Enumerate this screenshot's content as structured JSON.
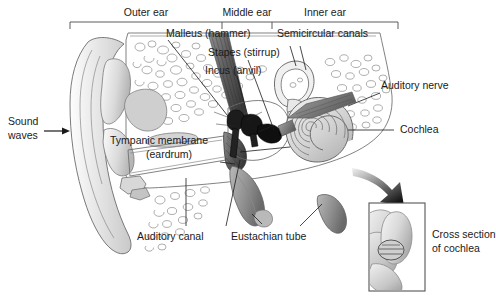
{
  "diagram": {
    "background_color": "#ffffff",
    "ink_color": "#1a1a1a",
    "outline_color": "#6b6b6b",
    "fill_light": "#e3e3e3",
    "fill_mid": "#bdbdbd",
    "fill_dark": "#555555",
    "fill_black": "#1c1c1c"
  },
  "region_brackets": {
    "outer_ear": {
      "label": "Outer ear"
    },
    "middle_ear": {
      "label": "Middle ear"
    },
    "inner_ear": {
      "label": "Inner ear"
    }
  },
  "labels": {
    "sound_waves_line1": "Sound",
    "sound_waves_line2": "waves",
    "malleus": "Malleus (hammer)",
    "stapes": "Stapes (stirrup)",
    "incus": "Incus (anvil)",
    "semicircular_canals": "Semicircular canals",
    "auditory_nerve": "Auditory nerve",
    "cochlea": "Cochlea",
    "tympanic_membrane_line1": "Tympanic membrane",
    "tympanic_membrane_line2": "(eardrum)",
    "auditory_canal": "Auditory canal",
    "eustachian_tube": "Eustachian tube",
    "cross_section_line1": "Cross section",
    "cross_section_line2": "of cochlea"
  },
  "icons": {
    "sound_arrow": "right-arrow-icon",
    "inset_arrow": "curved-down-arrow-icon"
  },
  "inset": {
    "name": "cross-section-of-cochlea-inset",
    "border_color": "#555555"
  }
}
